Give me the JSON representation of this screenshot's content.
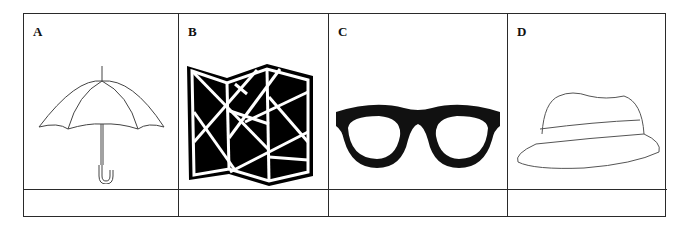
{
  "items": [
    {
      "letter": "A",
      "icon": "umbrella-icon",
      "answer": ""
    },
    {
      "letter": "B",
      "icon": "folded-map-icon",
      "answer": ""
    },
    {
      "letter": "C",
      "icon": "glasses-icon",
      "answer": ""
    },
    {
      "letter": "D",
      "icon": "hat-icon",
      "answer": ""
    }
  ]
}
